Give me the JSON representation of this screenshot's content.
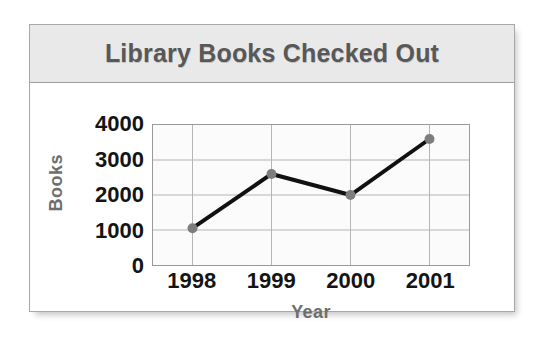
{
  "figure": {
    "title": "Library Books Checked Out",
    "y_axis_title": "Books",
    "x_axis_title": "Year"
  },
  "chart_data": {
    "type": "line",
    "title": "Library Books Checked Out",
    "subtitle": "",
    "xlabel": "Year",
    "ylabel": "Books",
    "categories": [
      "1998",
      "1999",
      "2000",
      "2001"
    ],
    "values": [
      1050,
      2600,
      2000,
      3600
    ],
    "series": [
      {
        "name": "Books Checked Out",
        "values": [
          1050,
          2600,
          2000,
          3600
        ]
      }
    ],
    "ylim": [
      0,
      4000
    ],
    "y_ticks": [
      4000,
      3000,
      2000,
      1000,
      0
    ],
    "y_tick_labels": [
      "4000",
      "3000",
      "2000",
      "1000",
      "0"
    ],
    "x_tick_labels": [
      "1998",
      "1999",
      "2000",
      "2001"
    ],
    "grid": true,
    "grid_horizontal": true,
    "grid_vertical": true,
    "legend": false,
    "legend_position": "none",
    "annotations": [],
    "colors": {
      "line": "#111111",
      "marker": "#7d7d7d",
      "grid": "#b4b4b4",
      "plot_background": "#fbfbfb",
      "plot_border": "#9a9a9a",
      "title_text": "#585858",
      "title_band": "#e9e9e9",
      "tick_text": "#141414",
      "axis_title_text": "#6e6e6e",
      "figure_background": "#ffffff",
      "figure_border": "#a8a8a8"
    },
    "style": {
      "line_width": 4,
      "marker_size": 5,
      "marker_shape": "circle"
    }
  }
}
